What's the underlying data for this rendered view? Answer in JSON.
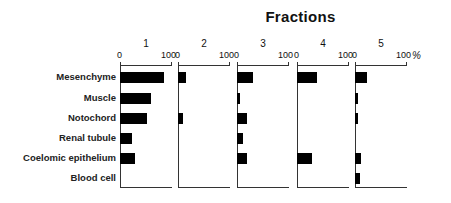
{
  "chart_data": {
    "type": "bar",
    "orientation": "horizontal",
    "title": "Fractions",
    "xlabel": "%",
    "ylabel": "",
    "xlim": [
      0,
      100
    ],
    "categories": [
      "Mesenchyme",
      "Muscle",
      "Notochord",
      "Renal tubule",
      "Coelomic epithelium",
      "Blood cell"
    ],
    "series": [
      {
        "name": "1",
        "values": [
          85,
          60,
          52,
          23,
          29,
          0
        ]
      },
      {
        "name": "2",
        "values": [
          15,
          0,
          10,
          0,
          0,
          0
        ]
      },
      {
        "name": "3",
        "values": [
          31,
          6,
          19,
          11,
          19,
          0
        ]
      },
      {
        "name": "4",
        "values": [
          39,
          0,
          0,
          0,
          28,
          0
        ]
      },
      {
        "name": "5",
        "values": [
          23,
          6,
          5,
          0,
          12,
          10
        ]
      }
    ],
    "tick_labels": [
      "0",
      "100"
    ],
    "unit": "%",
    "grid": false,
    "legend": "none; panels labeled 1-5 above each axis"
  },
  "labels": {
    "title": "Fractions",
    "unit": "%",
    "tick_zero": "0",
    "tick_hundred": "100",
    "panels": [
      "1",
      "2",
      "3",
      "4",
      "5"
    ],
    "rows": [
      "Mesenchyme",
      "Muscle",
      "Notochord",
      "Renal tubule",
      "Coelomic epithelium",
      "Blood cell"
    ]
  }
}
